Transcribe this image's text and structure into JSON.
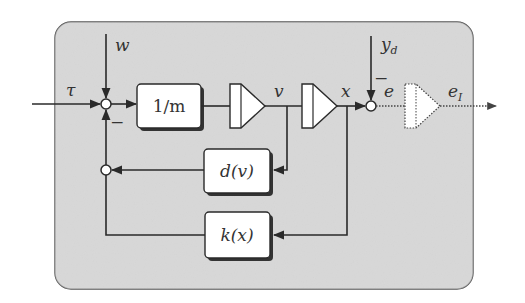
{
  "diagram": {
    "type": "block-diagram",
    "container": {
      "fill": "#d9d9d9",
      "stroke": "#555555"
    },
    "colors": {
      "line": "#2a2a2a",
      "block_fill": "#ffffff",
      "shadow": "#333333",
      "text": "#333333"
    },
    "inputs": {
      "tau": "τ",
      "w": "w",
      "y_d": "y",
      "y_d_sub": "d"
    },
    "blocks": {
      "inv_mass": "1/m",
      "damping": "d(v)",
      "stiffness": "k(x)"
    },
    "integrators": [
      {
        "id": "int-v",
        "style": "solid"
      },
      {
        "id": "int-x",
        "style": "solid"
      },
      {
        "id": "int-e",
        "style": "dotted"
      }
    ],
    "signals": {
      "v": "v",
      "x": "x",
      "e": "e",
      "e_I": "e",
      "e_I_sub": "I"
    },
    "signs": {
      "sum1_minus": "−",
      "sum2_minus": "−"
    },
    "edges": [
      {
        "from": "tau",
        "to": "sum1"
      },
      {
        "from": "w",
        "to": "sum1"
      },
      {
        "from": "sum2-feedback",
        "to": "sum1",
        "sign": "-"
      },
      {
        "from": "sum1",
        "to": "inv_mass"
      },
      {
        "from": "inv_mass",
        "to": "int-v"
      },
      {
        "from": "int-v",
        "to": "int-x",
        "label": "v"
      },
      {
        "from": "v",
        "to": "damping"
      },
      {
        "from": "int-x",
        "to": "sum-e",
        "label": "x"
      },
      {
        "from": "x",
        "to": "stiffness"
      },
      {
        "from": "y_d",
        "to": "sum-e",
        "sign": "-"
      },
      {
        "from": "damping",
        "to": "feedback-sum"
      },
      {
        "from": "stiffness",
        "to": "feedback-sum"
      },
      {
        "from": "sum-e",
        "to": "int-e",
        "label": "e"
      },
      {
        "from": "int-e",
        "to": "output",
        "label": "e_I"
      }
    ]
  }
}
